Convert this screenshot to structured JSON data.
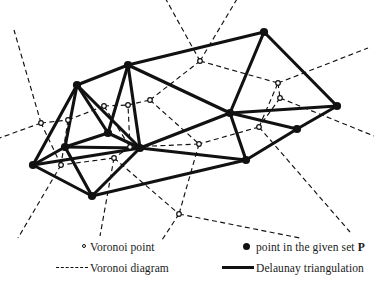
{
  "figure": {
    "background": "#ffffff",
    "ink_color": "#111111"
  },
  "legend": {
    "items": [
      {
        "symbol": "hollow-dot",
        "label": "Voronoi point"
      },
      {
        "symbol": "dashed-line",
        "label": "Voronoi diagram"
      },
      {
        "symbol": "filled-dot",
        "label_prefix": "point in the given set ",
        "label_bold": "P"
      },
      {
        "symbol": "solid-line",
        "label": "Delaunay triangulation"
      }
    ],
    "voronoi_point_label": "Voronoi point",
    "voronoi_diagram_label": "Voronoi diagram",
    "given_set_label": "point in the given set ",
    "given_set_symbol": "P",
    "delaunay_label": "Delaunay triangulation"
  },
  "chart_data": {
    "type": "scatter",
    "xlabel": "",
    "ylabel": "",
    "xlim": [
      0,
      382
    ],
    "ylim": [
      0,
      287
    ],
    "grid": false,
    "legend_position": "bottom",
    "site_points": [
      {
        "id": "s0",
        "x": 33,
        "y": 165
      },
      {
        "id": "s1",
        "x": 77,
        "y": 85
      },
      {
        "id": "s2",
        "x": 128,
        "y": 65
      },
      {
        "id": "s3",
        "x": 264,
        "y": 32
      },
      {
        "id": "s4",
        "x": 337,
        "y": 106
      },
      {
        "id": "s5",
        "x": 297,
        "y": 129
      },
      {
        "id": "s6",
        "x": 246,
        "y": 160
      },
      {
        "id": "s7",
        "x": 92,
        "y": 196
      },
      {
        "id": "s8",
        "x": 65,
        "y": 147
      },
      {
        "id": "s9",
        "x": 108,
        "y": 133
      },
      {
        "id": "s10",
        "x": 140,
        "y": 148
      },
      {
        "id": "s11",
        "x": 230,
        "y": 113
      }
    ],
    "voronoi_vertices": [
      {
        "id": "v0",
        "x": 41,
        "y": 123
      },
      {
        "id": "v1",
        "x": 68,
        "y": 120
      },
      {
        "id": "v2",
        "x": 104,
        "y": 106
      },
      {
        "id": "v3",
        "x": 128,
        "y": 105
      },
      {
        "id": "v4",
        "x": 150,
        "y": 100
      },
      {
        "id": "v5",
        "x": 200,
        "y": 61
      },
      {
        "id": "v6",
        "x": 278,
        "y": 83
      },
      {
        "id": "v7",
        "x": 280,
        "y": 98
      },
      {
        "id": "v8",
        "x": 259,
        "y": 127
      },
      {
        "id": "v9",
        "x": 199,
        "y": 144
      },
      {
        "id": "v10",
        "x": 130,
        "y": 147
      },
      {
        "id": "v11",
        "x": 114,
        "y": 158
      },
      {
        "id": "v12",
        "x": 61,
        "y": 165
      },
      {
        "id": "v13",
        "x": 179,
        "y": 214
      }
    ],
    "delaunay_edges": [
      [
        "s0",
        "s1"
      ],
      [
        "s0",
        "s8"
      ],
      [
        "s0",
        "s7"
      ],
      [
        "s0",
        "s10"
      ],
      [
        "s1",
        "s2"
      ],
      [
        "s1",
        "s8"
      ],
      [
        "s1",
        "s9"
      ],
      [
        "s1",
        "s10"
      ],
      [
        "s2",
        "s3"
      ],
      [
        "s2",
        "s9"
      ],
      [
        "s2",
        "s10"
      ],
      [
        "s2",
        "s11"
      ],
      [
        "s3",
        "s4"
      ],
      [
        "s3",
        "s11"
      ],
      [
        "s4",
        "s5"
      ],
      [
        "s4",
        "s11"
      ],
      [
        "s5",
        "s6"
      ],
      [
        "s5",
        "s11"
      ],
      [
        "s6",
        "s7"
      ],
      [
        "s6",
        "s10"
      ],
      [
        "s6",
        "s11"
      ],
      [
        "s7",
        "s8"
      ],
      [
        "s7",
        "s10"
      ],
      [
        "s8",
        "s9"
      ],
      [
        "s8",
        "s10"
      ],
      [
        "s9",
        "s10"
      ],
      [
        "s10",
        "s11"
      ]
    ],
    "voronoi_edges": [
      [
        "v0",
        "v1"
      ],
      [
        "v1",
        "v2"
      ],
      [
        "v2",
        "v3"
      ],
      [
        "v3",
        "v4"
      ],
      [
        "v4",
        "v5"
      ],
      [
        "v5",
        "v6"
      ],
      [
        "v6",
        "v7"
      ],
      [
        "v7",
        "v8"
      ],
      [
        "v8",
        "v9"
      ],
      [
        "v9",
        "v10"
      ],
      [
        "v10",
        "v11"
      ],
      [
        "v11",
        "v12"
      ],
      [
        "v12",
        "v0"
      ],
      [
        "v1",
        "v12"
      ],
      [
        "v2",
        "v10"
      ],
      [
        "v10",
        "v3"
      ],
      [
        "v4",
        "v9"
      ],
      [
        "v9",
        "v13"
      ],
      [
        "v11",
        "v13"
      ],
      [
        "v8",
        "v6"
      ]
    ],
    "voronoi_rays": [
      {
        "from": "v0",
        "to_x": -6,
        "to_y": 140
      },
      {
        "from": "v0",
        "to_x": 14,
        "to_y": 30
      },
      {
        "from": "v5",
        "to_x": 163,
        "to_y": -6
      },
      {
        "from": "v5",
        "to_x": 240,
        "to_y": -6
      },
      {
        "from": "v6",
        "to_x": 368,
        "to_y": 48
      },
      {
        "from": "v7",
        "to_x": 374,
        "to_y": 136
      },
      {
        "from": "v8",
        "to_x": 350,
        "to_y": 232
      },
      {
        "from": "v13",
        "to_x": 300,
        "to_y": 238
      },
      {
        "from": "v13",
        "to_x": 162,
        "to_y": 240
      },
      {
        "from": "v12",
        "to_x": 18,
        "to_y": 238
      },
      {
        "from": "v11",
        "to_x": 100,
        "to_y": 236
      }
    ]
  }
}
